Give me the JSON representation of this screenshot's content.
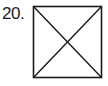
{
  "problem": {
    "number_label": "20."
  },
  "figure": {
    "shape": "square",
    "diagonals": 2,
    "stroke_color": "#1a1a1a",
    "fill_color": "#ffffff"
  }
}
